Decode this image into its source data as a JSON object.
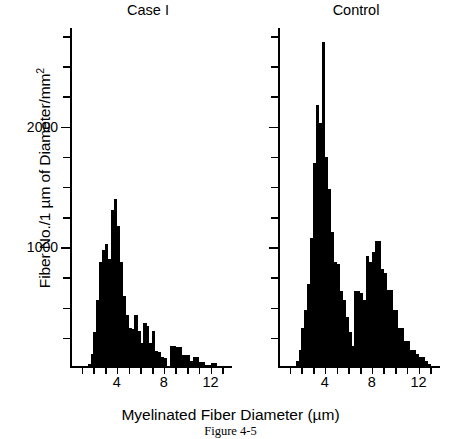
{
  "figure": {
    "caption": "Figure 4-5",
    "xlabel": "Myelinated Fiber Diameter (µm)",
    "ylabel_main": "Fiber No./1 µm of Diameter/mm",
    "ylabel_sup": "2"
  },
  "chart_data": {
    "type": "bar",
    "xlabel": "Myelinated Fiber Diameter (µm)",
    "ylabel": "Fiber No./1 µm of Diameter/mm²",
    "xlim": [
      0,
      14
    ],
    "ylim": [
      0,
      2800
    ],
    "bin_width": 0.25,
    "grid": false,
    "legend": "none",
    "x_ticks_major": [
      4,
      8,
      12
    ],
    "x_ticks_major_labels": [
      "4",
      "8",
      "12"
    ],
    "x_ticks_minor": [
      1,
      2,
      3,
      5,
      6,
      7,
      9,
      10,
      11,
      13
    ],
    "y_ticks_major": [
      1000,
      2000
    ],
    "y_ticks_major_labels": [
      "1000",
      "2000"
    ],
    "y_ticks_minor": [
      250,
      500,
      750,
      1250,
      1500,
      1750,
      2250,
      2500,
      2750
    ],
    "panels": [
      {
        "name": "case-1",
        "title": "Case I",
        "x": [
          1.5,
          1.75,
          2.0,
          2.25,
          2.5,
          2.75,
          3.0,
          3.25,
          3.5,
          3.75,
          4.0,
          4.25,
          4.5,
          4.75,
          5.0,
          5.25,
          5.5,
          5.75,
          6.0,
          6.25,
          6.5,
          6.75,
          7.0,
          7.25,
          7.5,
          7.75,
          8.0,
          8.25,
          8.5,
          8.75,
          9.0,
          9.25,
          9.5,
          9.75,
          10.0,
          10.25,
          10.5,
          10.75,
          11.0,
          11.25,
          11.5,
          11.75,
          12.0,
          12.25,
          12.5,
          12.75,
          13.0
        ],
        "values": [
          30,
          120,
          300,
          560,
          880,
          980,
          1030,
          900,
          1310,
          1400,
          1180,
          880,
          600,
          440,
          330,
          320,
          440,
          310,
          210,
          370,
          350,
          210,
          310,
          140,
          130,
          90,
          80,
          0,
          180,
          180,
          170,
          170,
          110,
          110,
          110,
          60,
          90,
          90,
          50,
          50,
          25,
          25,
          40,
          40,
          20,
          20,
          10
        ]
      },
      {
        "name": "control",
        "title": "Control",
        "x": [
          1.5,
          1.75,
          2.0,
          2.25,
          2.5,
          2.75,
          3.0,
          3.25,
          3.5,
          3.75,
          4.0,
          4.25,
          4.5,
          4.75,
          5.0,
          5.25,
          5.5,
          5.75,
          6.0,
          6.25,
          6.5,
          6.75,
          7.0,
          7.25,
          7.5,
          7.75,
          8.0,
          8.25,
          8.5,
          8.75,
          9.0,
          9.25,
          9.5,
          9.75,
          10.0,
          10.25,
          10.5,
          10.75,
          11.0,
          11.25,
          11.5,
          11.75,
          12.0,
          12.25,
          12.5,
          12.75,
          13.0
        ],
        "values": [
          60,
          150,
          330,
          480,
          700,
          1080,
          1700,
          2180,
          2030,
          2700,
          1750,
          1480,
          1130,
          880,
          860,
          640,
          560,
          420,
          300,
          180,
          640,
          640,
          620,
          560,
          930,
          880,
          960,
          1050,
          1050,
          820,
          790,
          650,
          650,
          480,
          480,
          330,
          330,
          220,
          220,
          150,
          150,
          120,
          90,
          90,
          60,
          30,
          20
        ]
      }
    ]
  }
}
